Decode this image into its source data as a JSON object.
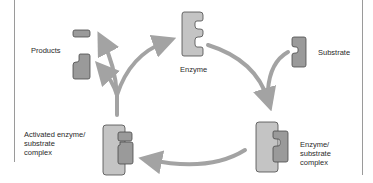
{
  "diagram": {
    "type": "enzyme catalytic cycle",
    "labels": {
      "enzyme": "Enzyme",
      "substrate": "Substrate",
      "enzyme_substrate_complex": [
        "Enzyme/",
        "substrate",
        "complex"
      ],
      "activated_complex": [
        "Activated enzyme/",
        "substrate",
        "complex"
      ],
      "products": "Products"
    },
    "colors": {
      "arrow": "#a3a3a3",
      "enzyme_fill": "#c4c4c4",
      "substrate_fill": "#9a9a9a",
      "outline": "#4a4a4a",
      "border": "#9a9a9a",
      "text": "#2a2a2a"
    },
    "flow": [
      "Enzyme",
      "Enzyme/substrate complex",
      "Activated enzyme/substrate complex",
      "Products + Enzyme"
    ]
  }
}
